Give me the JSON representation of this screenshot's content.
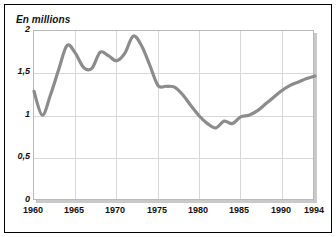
{
  "chart_data": {
    "type": "line",
    "title": "En millions",
    "xlabel": "",
    "ylabel": "",
    "ylim": [
      0,
      2
    ],
    "xlim": [
      1960,
      1994
    ],
    "grid": true,
    "legend": null,
    "yticks": [
      "0",
      "0,5",
      "1",
      "1,5",
      "2"
    ],
    "ytick_values": [
      0,
      0.5,
      1,
      1.5,
      2
    ],
    "xticks": [
      "1960",
      "1965",
      "1970",
      "1975",
      "1980",
      "1985",
      "1990",
      "1994"
    ],
    "xtick_values": [
      1960,
      1965,
      1970,
      1975,
      1980,
      1985,
      1990,
      1994
    ],
    "line_color": "#8c8c8c",
    "x": [
      1960,
      1961,
      1962,
      1963,
      1964,
      1965,
      1966,
      1967,
      1968,
      1969,
      1970,
      1971,
      1972,
      1973,
      1974,
      1975,
      1976,
      1977,
      1978,
      1979,
      1980,
      1981,
      1982,
      1983,
      1984,
      1985,
      1986,
      1987,
      1988,
      1989,
      1990,
      1991,
      1992,
      1993,
      1994
    ],
    "values": [
      1.29,
      1.01,
      1.25,
      1.55,
      1.83,
      1.74,
      1.57,
      1.56,
      1.75,
      1.71,
      1.65,
      1.74,
      1.94,
      1.83,
      1.6,
      1.36,
      1.35,
      1.34,
      1.25,
      1.12,
      1.0,
      0.91,
      0.86,
      0.94,
      0.91,
      0.99,
      1.01,
      1.06,
      1.14,
      1.22,
      1.3,
      1.36,
      1.4,
      1.44,
      1.47
    ]
  },
  "axes": {
    "y_labels": [
      "2",
      "1,5",
      "1",
      "0,5",
      "0"
    ],
    "x_labels": [
      "1960",
      "1965",
      "1970",
      "1975",
      "1980",
      "1985",
      "1990",
      "1994"
    ]
  }
}
